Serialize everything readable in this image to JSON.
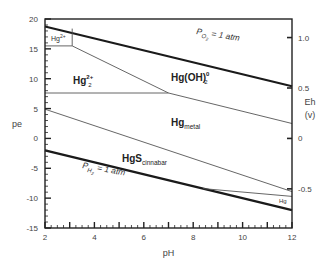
{
  "chart_data": {
    "type": "line",
    "title": "",
    "xlabel": "pH",
    "ylabel": "pe",
    "y2label": "Eh",
    "y2unit": "(v)",
    "xlim": [
      2,
      12
    ],
    "ylim": [
      -15,
      20
    ],
    "y2lim_volts": [
      -0.885,
      1.18
    ],
    "x_ticks": [
      2,
      4,
      6,
      8,
      10,
      12
    ],
    "y_ticks": [
      20,
      15,
      10,
      5,
      0,
      -5,
      -10,
      -15
    ],
    "y2_ticks": [
      1.0,
      0.5,
      0,
      -0.5
    ],
    "grid": false,
    "legend": "none",
    "boundaries": [
      {
        "name": "PO2 = 1 atm",
        "weight": "thick",
        "points": [
          [
            2,
            18.75
          ],
          [
            12,
            8.75
          ]
        ]
      },
      {
        "name": "PH2 = 1 atm",
        "weight": "thick",
        "points": [
          [
            2,
            -2
          ],
          [
            12,
            -12
          ]
        ]
      },
      {
        "name": "Hg2+ / Hg2 2+",
        "weight": "thin",
        "points": [
          [
            2,
            15.5
          ],
          [
            3.1,
            15.5
          ]
        ]
      },
      {
        "name": "Hg2+ box edge",
        "weight": "thin",
        "points": [
          [
            3.1,
            15.5
          ],
          [
            3.1,
            18.4
          ]
        ]
      },
      {
        "name": "Hg2 2+ / Hg(OH)2 0",
        "weight": "thin",
        "points": [
          [
            3.1,
            15.5
          ],
          [
            7.0,
            7.6
          ]
        ]
      },
      {
        "name": "Hg2 2+ / Hg metal",
        "weight": "thin",
        "points": [
          [
            2,
            7.6
          ],
          [
            7.0,
            7.6
          ]
        ]
      },
      {
        "name": "Hg(OH)2 0 / Hg metal",
        "weight": "thin",
        "points": [
          [
            7.0,
            7.6
          ],
          [
            12,
            2.5
          ]
        ]
      },
      {
        "name": "Hg metal / HgS cinnabar",
        "weight": "thin",
        "points": [
          [
            2,
            4.9
          ],
          [
            12,
            -8.9
          ]
        ]
      },
      {
        "name": "HgS cinnabar / Hg (lower)",
        "weight": "thin",
        "points": [
          [
            8.4,
            -8.4
          ],
          [
            12,
            -9.7
          ]
        ]
      }
    ],
    "annotations": [
      {
        "text": "PO2 = 1 atm",
        "x": 6.3,
        "y": 17.5
      },
      {
        "text": "PH2 = 1 atm",
        "x": 3.2,
        "y": -5.5
      },
      {
        "text": "Hg2+",
        "x": 2.15,
        "y": 17.2
      },
      {
        "text": "Hg2 2+",
        "x": 3.2,
        "y": 10
      },
      {
        "text": "Hg(OH)2 0",
        "x": 6.9,
        "y": 11.5
      },
      {
        "text": "Hg metal",
        "x": 8.5,
        "y": 4
      },
      {
        "text": "HgS cinnabar",
        "x": 5.5,
        "y": -3.2
      },
      {
        "text": "Hg",
        "x": 11.3,
        "y": -10.3
      }
    ]
  },
  "labels": {
    "xlabel": "pH",
    "ylabel": "pe",
    "y2label": "Eh",
    "y2unit": "(v)",
    "o2_p": "P",
    "o2_sub": "O",
    "o2_subsub": "2",
    "o2_rest": " = 1 atm",
    "h2_p": "P",
    "h2_sub": "H",
    "h2_subsub": "2",
    "h2_rest": " = 1 atm",
    "hg2plus_base": "Hg",
    "hg2plus_sup": "2+",
    "hg22plus_base": "Hg",
    "hg22plus_sup": "2+",
    "hg22plus_sub": "2",
    "hgoh_base": "Hg(OH)",
    "hgoh_sup": "0",
    "hgoh_sub": "2",
    "hgmetal_base": "Hg",
    "hgmetal_sub": "metal",
    "hgs_base": "HgS",
    "hgs_sub": "cinnabar",
    "hg_small": "Hg"
  }
}
